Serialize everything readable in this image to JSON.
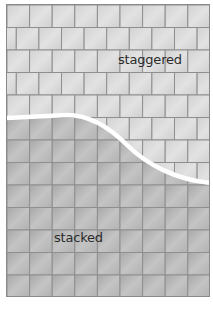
{
  "diagram": {
    "type": "tile-pattern-comparison",
    "regions": [
      {
        "id": "staggered",
        "label": "staggered",
        "pattern": "running bond (half-offset rows)"
      },
      {
        "id": "stacked",
        "label": "stacked",
        "pattern": "straight grid (aligned rows)"
      }
    ],
    "divider": {
      "shape": "S-curve",
      "color": "#ffffff"
    },
    "colors": {
      "tile_light": "#d6d6d6",
      "tile_dark": "#b0b0b0",
      "grout": "#8f8f8f",
      "frame": "#8a8a8a"
    },
    "tile": {
      "width": 22.6,
      "height": 22.5
    }
  }
}
